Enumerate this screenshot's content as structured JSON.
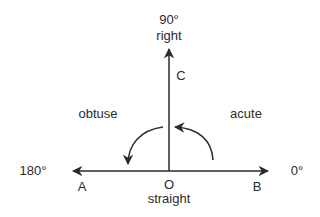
{
  "diagram": {
    "type": "angle-types",
    "colors": {
      "stroke": "#2b2b2b",
      "text": "#2b2b2b",
      "background": "#ffffff"
    },
    "degrees": {
      "top": "90°",
      "left": "180°",
      "right": "0°"
    },
    "angle_names": {
      "top": "right",
      "bottom": "straight",
      "left": "obtuse",
      "right": "acute"
    },
    "points": {
      "A": "A",
      "B": "B",
      "C": "C",
      "O": "O"
    }
  }
}
